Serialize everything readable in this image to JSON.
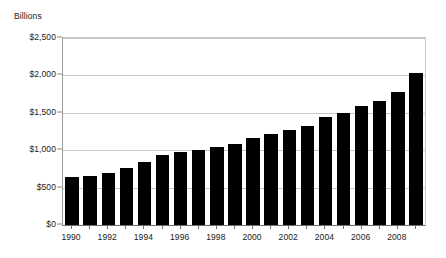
{
  "chart_data": {
    "type": "bar",
    "title": "",
    "subtitle": "",
    "xlabel": "",
    "ylabel": "Billions",
    "ylim": [
      0,
      2500
    ],
    "ytick_values": [
      0,
      500,
      1000,
      1500,
      2000,
      2500
    ],
    "ytick_labels": [
      "$0",
      "$500",
      "$1,000",
      "$1,500",
      "$2,000",
      "$2,500"
    ],
    "grid": "horizontal",
    "legend": "none",
    "bar_color": "#000000",
    "gridline_color": "#c8c8c8",
    "axis_color": "#6e6e6e",
    "categories": [
      "1990",
      "1991",
      "1992",
      "1993",
      "1994",
      "1995",
      "1996",
      "1997",
      "1998",
      "1999",
      "2000",
      "2001",
      "2002",
      "2003",
      "2004",
      "2005",
      "2006",
      "2007",
      "2008",
      "2009"
    ],
    "xtick_labels_shown": [
      "1990",
      "1992",
      "1994",
      "1996",
      "1998",
      "2000",
      "2002",
      "2004",
      "2006",
      "2008"
    ],
    "values": [
      645,
      655,
      700,
      760,
      840,
      930,
      975,
      1000,
      1040,
      1080,
      1165,
      1220,
      1270,
      1330,
      1450,
      1500,
      1590,
      1660,
      1780,
      2030
    ],
    "value_unit": "Billions of dollars",
    "annotations": []
  }
}
